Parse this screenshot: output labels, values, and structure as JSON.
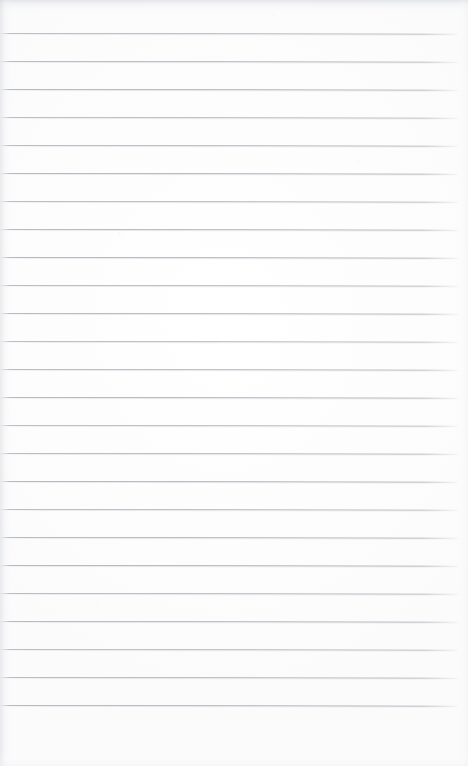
{
  "document": {
    "kind": "scanned-ruled-paper",
    "title": "Blank lined notebook page",
    "width_px": 468,
    "height_px": 766,
    "content_text": "",
    "is_blank": true
  },
  "colors": {
    "paper": "#fefefe",
    "paper_tint": "#fbfbfc",
    "rule_line": "#abaeb5",
    "rule_line_soft": "#d6d8dc",
    "scan_edge": "#cdcfd4"
  },
  "ruling": {
    "line_count": 25,
    "first_line_y": 33,
    "line_spacing_px": 28,
    "line_thickness_px": 1,
    "line_start_x": 1,
    "line_end_x": 459,
    "skew_degrees": 0.08,
    "lines_y": [
      33,
      61,
      89,
      117,
      145,
      173,
      201,
      229,
      257,
      285,
      313,
      341,
      369,
      397,
      425,
      453,
      481,
      509,
      537,
      565,
      593,
      621,
      649,
      677,
      705
    ]
  },
  "marks": [
    {
      "name": "speck-upper-left",
      "x": 118,
      "y": 232,
      "size": 3,
      "opacity": 0.26
    },
    {
      "name": "speck-upper-right",
      "x": 357,
      "y": 160,
      "size": 3,
      "opacity": 0.22
    },
    {
      "name": "speck-top-center",
      "x": 272,
      "y": 14,
      "size": 3,
      "opacity": 0.2
    },
    {
      "name": "speck-mid-right",
      "x": 392,
      "y": 498,
      "size": 2,
      "opacity": 0.18
    },
    {
      "name": "speck-lower-left",
      "x": 96,
      "y": 602,
      "size": 2,
      "opacity": 0.16
    }
  ]
}
